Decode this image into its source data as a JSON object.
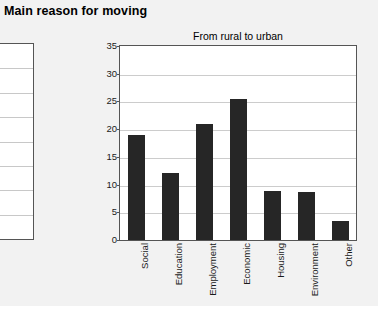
{
  "page": {
    "heading": "Main reason for moving",
    "panel_color": "#f2f2f2",
    "background_color": "#ffffff"
  },
  "left_chart": {
    "note": "partially visible chart cropped at the left edge",
    "gridline_count": 7,
    "bar_color": "#9a9a9a"
  },
  "chart_data": {
    "type": "bar",
    "title": "From rural to urban",
    "xlabel": "",
    "ylabel": "",
    "ylim": [
      0,
      35
    ],
    "yticks": [
      0,
      5,
      10,
      15,
      20,
      25,
      30,
      35
    ],
    "ytick_labels": [
      "0",
      "5",
      "10",
      "15",
      "20",
      "25",
      "30",
      "35"
    ],
    "grid": true,
    "legend": false,
    "bar_color": "#262626",
    "categories": [
      "Social",
      "Education",
      "Employment",
      "Economic",
      "Housing",
      "Environment",
      "Other"
    ],
    "values": [
      19.0,
      12.1,
      21.0,
      25.5,
      8.8,
      8.6,
      3.4
    ]
  }
}
